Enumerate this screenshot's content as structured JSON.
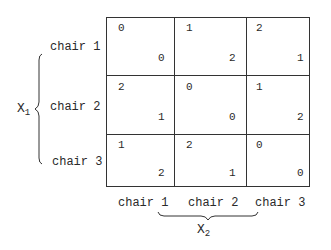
{
  "diagram": {
    "type": "two-player payoff matrix",
    "row_player": {
      "label": "X",
      "subscript": "1"
    },
    "col_player": {
      "label": "X",
      "subscript": "2"
    },
    "rows": [
      "chair 1",
      "chair 2",
      "chair 3"
    ],
    "columns": [
      "chair 1",
      "chair 2",
      "chair 3"
    ],
    "cells": [
      [
        {
          "top_left": "0",
          "bottom_right": "0"
        },
        {
          "top_left": "1",
          "bottom_right": "2"
        },
        {
          "top_left": "2",
          "bottom_right": "1"
        }
      ],
      [
        {
          "top_left": "2",
          "bottom_right": "1"
        },
        {
          "top_left": "0",
          "bottom_right": "0"
        },
        {
          "top_left": "1",
          "bottom_right": "2"
        }
      ],
      [
        {
          "top_left": "1",
          "bottom_right": "2"
        },
        {
          "top_left": "2",
          "bottom_right": "1"
        },
        {
          "top_left": "0",
          "bottom_right": "0"
        }
      ]
    ]
  }
}
